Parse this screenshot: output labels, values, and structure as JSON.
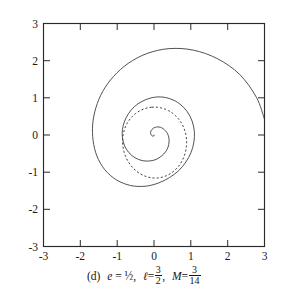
{
  "figure": {
    "panel_label": "(d)",
    "caption_parts": {
      "e_symbol": "e",
      "e_equals": "=",
      "e_value": "½",
      "comma_1": ",",
      "l_symbol": "ℓ",
      "l_equals": "=",
      "l_num": "3",
      "l_den": "2",
      "comma_2": ",",
      "M_symbol": "M",
      "M_equals": "=",
      "M_num": "3",
      "M_den": "14"
    },
    "caption_plain": "(d) e = ½, ℓ = 3/2, M = 3/14"
  },
  "chart_data": {
    "type": "line",
    "title": "",
    "subtitle": "",
    "xlabel": "",
    "ylabel": "",
    "xlim": [
      -3,
      3
    ],
    "ylim": [
      -3,
      3
    ],
    "grid": false,
    "legend_position": "none",
    "aspect": "equal",
    "axis": {
      "frame": "box",
      "tick_direction": "in",
      "xticks": [
        -3,
        -2,
        -1,
        0,
        1,
        2,
        3
      ],
      "yticks": [
        -3,
        -2,
        -1,
        0,
        1,
        2,
        3
      ],
      "xticklabels": [
        "-3",
        "-2",
        "-1",
        "0",
        "1",
        "2",
        "3"
      ],
      "yticklabels": [
        "-3",
        "-2",
        "-1",
        "0",
        "1",
        "2",
        "3"
      ]
    },
    "parameters": {
      "e": 0.5,
      "e_text": "½",
      "l": 1.5,
      "l_text": "3/2",
      "M": 0.214285714,
      "M_text": "3/14"
    },
    "series": [
      {
        "name": "relativistic-orbit",
        "style": "solid",
        "color": "#32323a",
        "description": "Inspiralling relativistic orbit entering from the right edge near (3, 0.45) and winding inward to the origin",
        "polar_r_of_phi": {
          "phi_start_deg": 8,
          "phi_end_deg": 1090,
          "r_start": 3.03,
          "r_end": 0.03
        },
        "points_polar_deg_r": [
          [
            8,
            3.03
          ],
          [
            20,
            2.96
          ],
          [
            35,
            2.84
          ],
          [
            50,
            2.68
          ],
          [
            65,
            2.52
          ],
          [
            80,
            2.36
          ],
          [
            95,
            2.2
          ],
          [
            110,
            2.05
          ],
          [
            125,
            1.92
          ],
          [
            140,
            1.82
          ],
          [
            155,
            1.74
          ],
          [
            170,
            1.69
          ],
          [
            185,
            1.66
          ],
          [
            200,
            1.65
          ],
          [
            215,
            1.63
          ],
          [
            230,
            1.58
          ],
          [
            245,
            1.5
          ],
          [
            260,
            1.4
          ],
          [
            275,
            1.3
          ],
          [
            290,
            1.22
          ],
          [
            305,
            1.17
          ],
          [
            320,
            1.13
          ],
          [
            335,
            1.11
          ],
          [
            350,
            1.1
          ],
          [
            365,
            1.1
          ],
          [
            380,
            1.1
          ],
          [
            395,
            1.1
          ],
          [
            410,
            1.09
          ],
          [
            425,
            1.07
          ],
          [
            440,
            1.04
          ],
          [
            455,
            1.0
          ],
          [
            470,
            0.96
          ],
          [
            485,
            0.93
          ],
          [
            500,
            0.9
          ],
          [
            515,
            0.88
          ],
          [
            530,
            0.87
          ],
          [
            545,
            0.86
          ],
          [
            560,
            0.85
          ],
          [
            575,
            0.83
          ],
          [
            590,
            0.8
          ],
          [
            605,
            0.76
          ],
          [
            620,
            0.71
          ],
          [
            635,
            0.66
          ],
          [
            650,
            0.6
          ],
          [
            665,
            0.55
          ],
          [
            680,
            0.5
          ],
          [
            695,
            0.45
          ],
          [
            710,
            0.41
          ],
          [
            725,
            0.37
          ],
          [
            740,
            0.33
          ],
          [
            755,
            0.3
          ],
          [
            770,
            0.27
          ],
          [
            785,
            0.24
          ],
          [
            800,
            0.21
          ],
          [
            815,
            0.185
          ],
          [
            830,
            0.16
          ],
          [
            845,
            0.14
          ],
          [
            860,
            0.12
          ],
          [
            875,
            0.1
          ],
          [
            890,
            0.085
          ],
          [
            905,
            0.07
          ],
          [
            920,
            0.058
          ],
          [
            935,
            0.047
          ],
          [
            950,
            0.038
          ],
          [
            965,
            0.03
          ],
          [
            980,
            0.024
          ],
          [
            995,
            0.019
          ],
          [
            1010,
            0.014
          ],
          [
            1025,
            0.011
          ],
          [
            1040,
            0.008
          ],
          [
            1055,
            0.006
          ],
          [
            1070,
            0.004
          ],
          [
            1090,
            0.002
          ]
        ],
        "extent_notes": {
          "leftmost_x": -1.45,
          "topmost_y": 2.4,
          "bottommost_y": -1.25,
          "rightmost_x": 3.0
        }
      },
      {
        "name": "newtonian-ellipse",
        "style": "dashed",
        "color": "#32323a",
        "description": "Reference Keplerian ellipse r = l/(1 + e cos(phi)) rendered as a dashed closed curve of semi-latus-rectum scale, apsides near r = 0.75 and r = 1.15",
        "conic": {
          "eccentricity": 0.5,
          "semi_latus_rectum": 0.92,
          "r_peri": 0.61,
          "r_apo": 1.84,
          "r_min_drawn": 0.75,
          "r_max_drawn": 1.16,
          "orientation_deg": 95
        }
      }
    ],
    "annotations": []
  }
}
